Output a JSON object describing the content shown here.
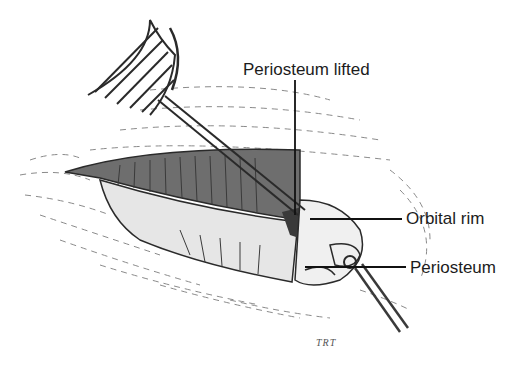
{
  "figure": {
    "labels": [
      {
        "id": "periosteum-lifted",
        "text": "Periosteum lifted"
      },
      {
        "id": "orbital-rim",
        "text": "Orbital rim"
      },
      {
        "id": "periosteum",
        "text": "Periosteum"
      }
    ],
    "signature": "TRT",
    "colors": {
      "background": "#ffffff",
      "ink": "#1c1c1c",
      "shading": "#555555"
    }
  }
}
